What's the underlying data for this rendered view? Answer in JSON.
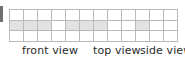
{
  "figure": {
    "type": "isometric-views-grid",
    "grid": {
      "columns": 12,
      "rows": 3,
      "border_color": "#b9b9b9",
      "cell_fill": "#ffffff",
      "shaded_fill": "#e2e2e2",
      "shaded_cells": [
        {
          "row": 2,
          "col": 1
        },
        {
          "row": 2,
          "col": 2
        },
        {
          "row": 2,
          "col": 3
        },
        {
          "row": 2,
          "col": 5
        },
        {
          "row": 2,
          "col": 6
        },
        {
          "row": 2,
          "col": 7
        },
        {
          "row": 2,
          "col": 10
        }
      ]
    },
    "labels": {
      "front": "front view",
      "top": "top view",
      "side": "side view"
    },
    "text_color": "#2b2b2b"
  }
}
